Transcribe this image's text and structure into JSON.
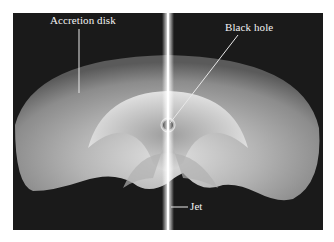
{
  "figure": {
    "labels": {
      "accretion_disk": "Accretion disk",
      "black_hole": "Black hole",
      "jet": "Jet"
    },
    "colors": {
      "background": "#1a1a1a",
      "disk_light": "#cfcfcf",
      "disk_mid": "#8a8a8a",
      "jet": "#f5f5f5",
      "label_text": "#f2f2f2"
    }
  }
}
